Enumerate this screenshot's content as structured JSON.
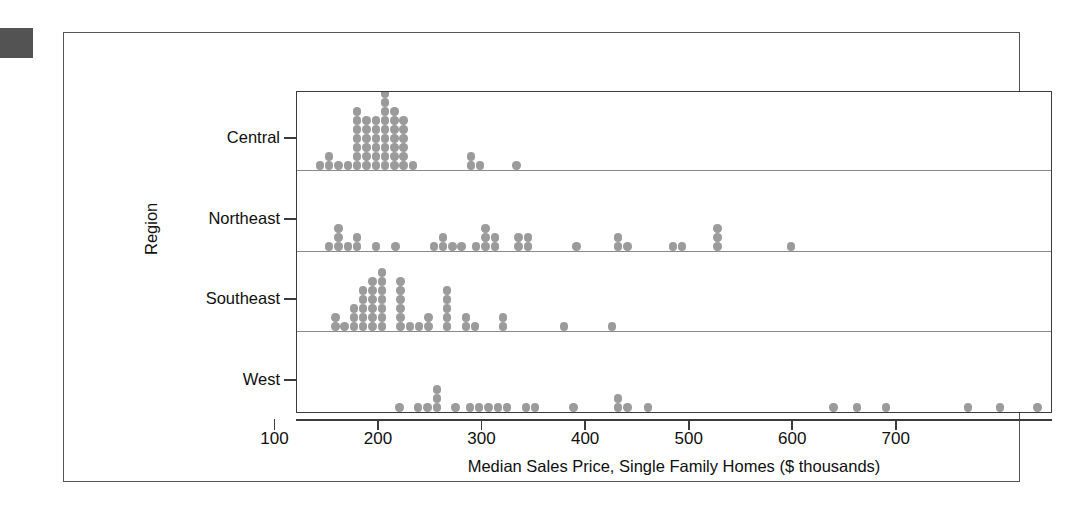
{
  "figure": {
    "corner_block_color": "#535353",
    "frame_color": "#555555",
    "panel_border_color": "#3b3b3b",
    "dot_color": "#9b9b9b",
    "baseline_color": "#8a8a8a"
  },
  "chart_data": {
    "type": "scatter",
    "plot_style": "dotplot",
    "title": "",
    "subtitle": "",
    "xlabel": "Median Sales Price, Single Family Homes ($ thousands)",
    "ylabel": "Region",
    "xlim": [
      60,
      790
    ],
    "xticks": [
      100,
      200,
      300,
      400,
      500,
      600,
      700
    ],
    "xtick_labels": [
      "100",
      "200",
      "300",
      "400",
      "500",
      "600",
      "700"
    ],
    "grid": false,
    "legend": "none",
    "categories": [
      "Central",
      "Northeast",
      "Southeast",
      "West"
    ],
    "bin_width": 9,
    "dot_diameter": 8.4,
    "series": [
      {
        "name": "Central",
        "bins": [
          {
            "x": 82,
            "count": 1
          },
          {
            "x": 91,
            "count": 2
          },
          {
            "x": 100,
            "count": 1
          },
          {
            "x": 109,
            "count": 1
          },
          {
            "x": 118,
            "count": 7
          },
          {
            "x": 127,
            "count": 6
          },
          {
            "x": 136,
            "count": 6
          },
          {
            "x": 145,
            "count": 9
          },
          {
            "x": 154,
            "count": 7
          },
          {
            "x": 163,
            "count": 6
          },
          {
            "x": 172,
            "count": 1
          },
          {
            "x": 228,
            "count": 2
          },
          {
            "x": 237,
            "count": 1
          },
          {
            "x": 272,
            "count": 1
          }
        ]
      },
      {
        "name": "Northeast",
        "bins": [
          {
            "x": 91,
            "count": 1
          },
          {
            "x": 100,
            "count": 3
          },
          {
            "x": 109,
            "count": 1
          },
          {
            "x": 118,
            "count": 2
          },
          {
            "x": 136,
            "count": 1
          },
          {
            "x": 155,
            "count": 1
          },
          {
            "x": 192,
            "count": 1
          },
          {
            "x": 201,
            "count": 2
          },
          {
            "x": 210,
            "count": 1
          },
          {
            "x": 219,
            "count": 1
          },
          {
            "x": 233,
            "count": 1
          },
          {
            "x": 242,
            "count": 3
          },
          {
            "x": 251,
            "count": 2
          },
          {
            "x": 274,
            "count": 2
          },
          {
            "x": 283,
            "count": 2
          },
          {
            "x": 330,
            "count": 1
          },
          {
            "x": 370,
            "count": 2
          },
          {
            "x": 379,
            "count": 1
          },
          {
            "x": 423,
            "count": 1
          },
          {
            "x": 432,
            "count": 1
          },
          {
            "x": 466,
            "count": 3
          },
          {
            "x": 537,
            "count": 1
          }
        ]
      },
      {
        "name": "Southeast",
        "bins": [
          {
            "x": 97,
            "count": 2
          },
          {
            "x": 106,
            "count": 1
          },
          {
            "x": 115,
            "count": 3
          },
          {
            "x": 124,
            "count": 5
          },
          {
            "x": 133,
            "count": 6
          },
          {
            "x": 142,
            "count": 7
          },
          {
            "x": 160,
            "count": 6
          },
          {
            "x": 169,
            "count": 1
          },
          {
            "x": 178,
            "count": 1
          },
          {
            "x": 187,
            "count": 2
          },
          {
            "x": 205,
            "count": 5
          },
          {
            "x": 223,
            "count": 2
          },
          {
            "x": 232,
            "count": 1
          },
          {
            "x": 259,
            "count": 2
          },
          {
            "x": 318,
            "count": 1
          },
          {
            "x": 364,
            "count": 1
          }
        ]
      },
      {
        "name": "West",
        "bins": [
          {
            "x": 159,
            "count": 1
          },
          {
            "x": 177,
            "count": 1
          },
          {
            "x": 186,
            "count": 1
          },
          {
            "x": 195,
            "count": 3
          },
          {
            "x": 213,
            "count": 1
          },
          {
            "x": 227,
            "count": 1
          },
          {
            "x": 236,
            "count": 1
          },
          {
            "x": 245,
            "count": 1
          },
          {
            "x": 254,
            "count": 1
          },
          {
            "x": 263,
            "count": 1
          },
          {
            "x": 281,
            "count": 1
          },
          {
            "x": 290,
            "count": 1
          },
          {
            "x": 327,
            "count": 1
          },
          {
            "x": 370,
            "count": 2
          },
          {
            "x": 379,
            "count": 1
          },
          {
            "x": 399,
            "count": 1
          },
          {
            "x": 578,
            "count": 1
          },
          {
            "x": 601,
            "count": 1
          },
          {
            "x": 629,
            "count": 1
          },
          {
            "x": 708,
            "count": 1
          },
          {
            "x": 739,
            "count": 1
          },
          {
            "x": 775,
            "count": 1
          }
        ]
      }
    ]
  }
}
